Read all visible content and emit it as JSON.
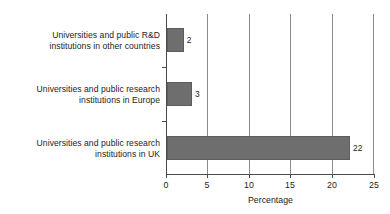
{
  "chart_data": {
    "type": "bar",
    "orientation": "horizontal",
    "title": "",
    "xlabel": "Percentage",
    "ylabel": "",
    "xlim": [
      0,
      25
    ],
    "xticks": [
      0,
      5,
      10,
      15,
      20,
      25
    ],
    "grid": "vertical",
    "legend": "none",
    "bar_color": "#6e6e6e",
    "categories": [
      "Universities and public R&D\ninstitutions in other countries",
      "Universities and public research\ninstitutions in Europe",
      "Universities and public research\ninstitutions in UK"
    ],
    "values": [
      2,
      3,
      22
    ],
    "value_labels": [
      "2",
      "3",
      "22"
    ],
    "tick_labels": [
      "0",
      "5",
      "10",
      "15",
      "20",
      "25"
    ]
  }
}
